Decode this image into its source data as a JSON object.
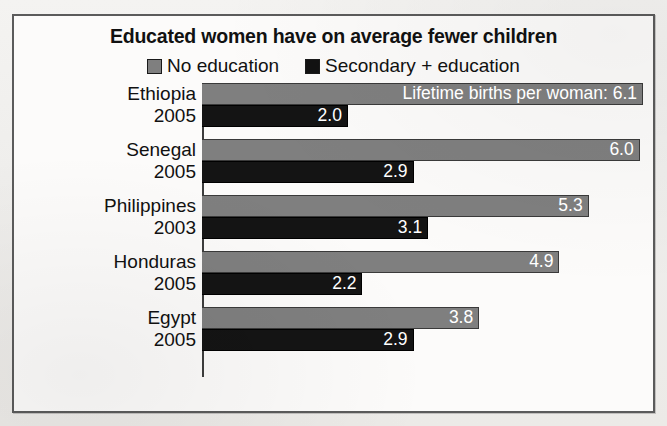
{
  "figure": {
    "title": "Educated women have on average fewer children",
    "legend": [
      {
        "label": "No education",
        "swatch": "gray-swatch",
        "color": "#7f7f7f"
      },
      {
        "label": "Secondary + education",
        "swatch": "black-swatch",
        "color": "#141414"
      }
    ],
    "annotation": "Lifetime births per woman:"
  },
  "chart_data": {
    "type": "bar",
    "orientation": "horizontal",
    "title": "Educated women have on average fewer children",
    "xlabel": "Lifetime births per woman",
    "ylabel": "",
    "xlim": [
      0,
      6.1
    ],
    "grid": false,
    "legend_position": "top-center",
    "categories": [
      "Ethiopia",
      "Senegal",
      "Philippines",
      "Honduras",
      "Egypt"
    ],
    "category_years": [
      "2005",
      "2005",
      "2003",
      "2005",
      "2005"
    ],
    "series": [
      {
        "name": "No education",
        "color": "#7f7f7f",
        "values": [
          6.1,
          6.0,
          5.3,
          4.9,
          3.8
        ]
      },
      {
        "name": "Secondary + education",
        "color": "#141414",
        "values": [
          2.0,
          2.9,
          3.1,
          2.2,
          2.9
        ]
      }
    ],
    "annotations": [
      {
        "category": "Ethiopia",
        "series": "No education",
        "text": "Lifetime births per woman: 6.1"
      }
    ],
    "rows": [
      {
        "country": "Ethiopia",
        "year": "2005",
        "no_education": "6.1",
        "secondary_education": "2.0",
        "annotation": "Lifetime births per woman: 6.1"
      },
      {
        "country": "Senegal",
        "year": "2005",
        "no_education": "6.0",
        "secondary_education": "2.9",
        "annotation": ""
      },
      {
        "country": "Philippines",
        "year": "2003",
        "no_education": "5.3",
        "secondary_education": "3.1",
        "annotation": ""
      },
      {
        "country": "Honduras",
        "year": "2005",
        "no_education": "4.9",
        "secondary_education": "2.2",
        "annotation": ""
      },
      {
        "country": "Egypt",
        "year": "2005",
        "no_education": "3.8",
        "secondary_education": "2.9",
        "annotation": ""
      }
    ]
  }
}
